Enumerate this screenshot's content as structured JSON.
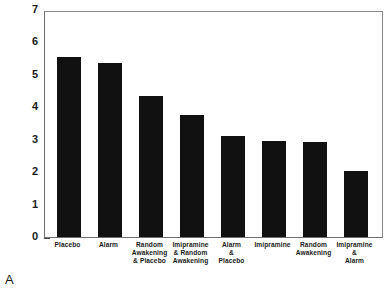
{
  "panel": {
    "letter": "A"
  },
  "chart_data": {
    "type": "bar",
    "title": "",
    "xlabel": "",
    "ylabel": "Number of Wet Nights for Week 2",
    "ylim": [
      0,
      7
    ],
    "yticks": [
      0,
      1,
      2,
      3,
      4,
      5,
      6,
      7
    ],
    "ytick_labels": [
      "0",
      "1",
      "2",
      "3",
      "4",
      "5",
      "6",
      "7"
    ],
    "grid": false,
    "legend": "none",
    "bar_color": "#111111",
    "categories": [
      "Placebo",
      "Alarm",
      "Random Awakening & Placebo",
      "Imipramine & Random Awakening",
      "Alarm & Placebo",
      "Imipramine",
      "Random Awakening",
      "Imipramine & Alarm"
    ],
    "category_lines": [
      [
        "Placebo"
      ],
      [
        "Alarm"
      ],
      [
        "Random",
        "Awakening",
        "& Placebo"
      ],
      [
        "Imipramine",
        "& Random",
        "Awakening"
      ],
      [
        "Alarm",
        "&",
        "Placebo"
      ],
      [
        "Imipramine"
      ],
      [
        "Random",
        "Awakening"
      ],
      [
        "Imipramine",
        "&",
        "Alarm"
      ]
    ],
    "values": [
      5.54,
      5.38,
      4.34,
      3.77,
      3.11,
      2.95,
      2.93,
      2.03
    ]
  }
}
